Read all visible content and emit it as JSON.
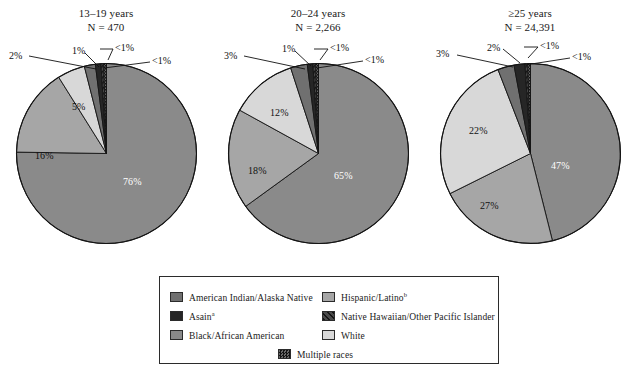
{
  "chart_data": {
    "type": "pie",
    "title": "",
    "subtitle": "",
    "legend_position": "bottom",
    "categories": [
      "Black/African American",
      "Hispanic/Latino",
      "White",
      "American Indian/Alaska Native",
      "Asian",
      "Native Hawaiian/Other Pacific Islander",
      "Multiple races"
    ],
    "charts": [
      {
        "title_line1": "13–19 years",
        "title_line2": "N = 470",
        "n": 470,
        "slices": [
          {
            "category": "Black/African American",
            "value": 76,
            "label": "76%",
            "color": "#8a8a8a",
            "pattern": "solid"
          },
          {
            "category": "Hispanic/Latino",
            "value": 16,
            "label": "16%",
            "color": "#a6a6a6",
            "pattern": "solid"
          },
          {
            "category": "White",
            "value": 5,
            "label": "5%",
            "color": "#d8d8d8",
            "pattern": "solid"
          },
          {
            "category": "American Indian/Alaska Native",
            "value": 2,
            "label": "2%",
            "color": "#707070",
            "pattern": "solid"
          },
          {
            "category": "Asian",
            "value": 1,
            "label": "1%",
            "color": "#262626",
            "pattern": "solid"
          },
          {
            "category": "Native Hawaiian/Other Pacific Islander",
            "value": 0.5,
            "label": "<1%",
            "color": "#3a3a3a",
            "pattern": "hatch"
          },
          {
            "category": "Multiple races",
            "value": 0.5,
            "label": "<1%",
            "color": "#3a3a3a",
            "pattern": "checker"
          }
        ]
      },
      {
        "title_line1": "20–24 years",
        "title_line2": "N = 2,266",
        "n": 2266,
        "slices": [
          {
            "category": "Black/African American",
            "value": 65,
            "label": "65%",
            "color": "#8a8a8a",
            "pattern": "solid"
          },
          {
            "category": "Hispanic/Latino",
            "value": 18,
            "label": "18%",
            "color": "#a6a6a6",
            "pattern": "solid"
          },
          {
            "category": "White",
            "value": 12,
            "label": "12%",
            "color": "#d8d8d8",
            "pattern": "solid"
          },
          {
            "category": "American Indian/Alaska Native",
            "value": 3,
            "label": "3%",
            "color": "#707070",
            "pattern": "solid"
          },
          {
            "category": "Asian",
            "value": 1,
            "label": "1%",
            "color": "#262626",
            "pattern": "solid"
          },
          {
            "category": "Native Hawaiian/Other Pacific Islander",
            "value": 0.5,
            "label": "<1%",
            "color": "#3a3a3a",
            "pattern": "hatch"
          },
          {
            "category": "Multiple races",
            "value": 0.5,
            "label": "<1%",
            "color": "#3a3a3a",
            "pattern": "checker"
          }
        ]
      },
      {
        "title_line1": "≥25 years",
        "title_line2": "N = 24,391",
        "n": 24391,
        "slices": [
          {
            "category": "Black/African American",
            "value": 47,
            "label": "47%",
            "color": "#8a8a8a",
            "pattern": "solid"
          },
          {
            "category": "Hispanic/Latino",
            "value": 22,
            "label": "22%",
            "color": "#a6a6a6",
            "pattern": "solid"
          },
          {
            "category": "White",
            "value": 27,
            "label": "27%",
            "color": "#d8d8d8",
            "pattern": "solid"
          },
          {
            "category": "American Indian/Alaska Native",
            "value": 3,
            "label": "3%",
            "color": "#707070",
            "pattern": "solid"
          },
          {
            "category": "Asian",
            "value": 2,
            "label": "2%",
            "color": "#262626",
            "pattern": "solid"
          },
          {
            "category": "Native Hawaiian/Other Pacific Islander",
            "value": 0.5,
            "label": "<1%",
            "color": "#3a3a3a",
            "pattern": "hatch"
          },
          {
            "category": "Multiple races",
            "value": 0.5,
            "label": "<1%",
            "color": "#3a3a3a",
            "pattern": "checker"
          }
        ]
      }
    ]
  },
  "legend": {
    "items": [
      {
        "label": "American Indian/Alaska Native",
        "sup": "",
        "color": "#707070",
        "pattern": "solid"
      },
      {
        "label": "Asain",
        "sup": "a",
        "color": "#262626",
        "pattern": "solid"
      },
      {
        "label": "Black/African American",
        "sup": "",
        "color": "#8a8a8a",
        "pattern": "solid"
      },
      {
        "label": "Hispanic/Latino",
        "sup": "b",
        "color": "#a6a6a6",
        "pattern": "solid"
      },
      {
        "label": "Native Hawaiian/Other Pacific Islander",
        "sup": "",
        "color": "#3a3a3a",
        "pattern": "hatch"
      },
      {
        "label": "White",
        "sup": "",
        "color": "#d8d8d8",
        "pattern": "solid"
      },
      {
        "label": "Multiple races",
        "sup": "",
        "color": "#3a3a3a",
        "pattern": "checker"
      }
    ]
  }
}
